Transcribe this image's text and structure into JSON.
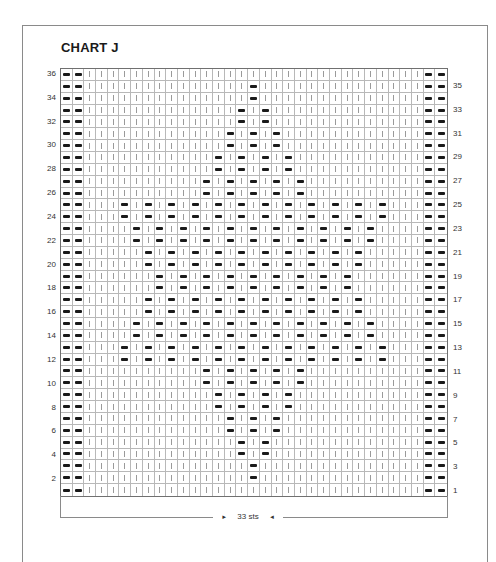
{
  "title": "CHART J",
  "chart_data": {
    "type": "table",
    "title": "CHART J",
    "columns": 33,
    "rows": 36,
    "width_label": "33 sts",
    "legend": {
      "knit": "|",
      "purl": "—"
    },
    "left_row_labels": [
      36,
      34,
      32,
      30,
      28,
      26,
      24,
      22,
      20,
      18,
      16,
      14,
      12,
      10,
      8,
      6,
      4,
      2
    ],
    "right_row_labels": [
      35,
      33,
      31,
      29,
      27,
      25,
      23,
      21,
      19,
      17,
      15,
      13,
      11,
      9,
      7,
      5,
      3,
      1
    ],
    "edge_purl_columns": [
      1,
      2,
      32,
      33
    ],
    "purl_columns_by_row": {
      "36": [],
      "35": [
        17
      ],
      "34": [
        17
      ],
      "33": [
        16,
        18
      ],
      "32": [
        16,
        18
      ],
      "31": [
        15,
        17,
        19
      ],
      "30": [
        15,
        17,
        19
      ],
      "29": [
        14,
        16,
        18,
        20
      ],
      "28": [
        14,
        16,
        18,
        20
      ],
      "27": [
        13,
        15,
        17,
        19,
        21
      ],
      "26": [
        13,
        15,
        17,
        19,
        21
      ],
      "25": [
        6,
        8,
        10,
        12,
        14,
        16,
        18,
        20,
        22,
        24,
        26,
        28
      ],
      "24": [
        6,
        8,
        10,
        12,
        14,
        16,
        18,
        20,
        22,
        24,
        26,
        28
      ],
      "23": [
        7,
        9,
        11,
        13,
        15,
        17,
        19,
        21,
        23,
        25,
        27
      ],
      "22": [
        7,
        9,
        11,
        13,
        15,
        17,
        19,
        21,
        23,
        25,
        27
      ],
      "21": [
        8,
        10,
        12,
        14,
        16,
        18,
        20,
        22,
        24,
        26
      ],
      "20": [
        8,
        10,
        12,
        14,
        16,
        18,
        20,
        22,
        24,
        26
      ],
      "19": [
        9,
        11,
        13,
        15,
        17,
        19,
        21,
        23,
        25
      ],
      "18": [
        9,
        11,
        13,
        15,
        17,
        19,
        21,
        23,
        25
      ],
      "17": [
        8,
        10,
        12,
        14,
        16,
        18,
        20,
        22,
        24,
        26
      ],
      "16": [
        8,
        10,
        12,
        14,
        16,
        18,
        20,
        22,
        24,
        26
      ],
      "15": [
        7,
        9,
        11,
        13,
        15,
        17,
        19,
        21,
        23,
        25,
        27
      ],
      "14": [
        7,
        9,
        11,
        13,
        15,
        17,
        19,
        21,
        23,
        25,
        27
      ],
      "13": [
        6,
        8,
        10,
        12,
        14,
        16,
        18,
        20,
        22,
        24,
        26,
        28
      ],
      "12": [
        6,
        8,
        10,
        12,
        14,
        16,
        18,
        20,
        22,
        24,
        26,
        28
      ],
      "11": [
        13,
        15,
        17,
        19,
        21
      ],
      "10": [
        13,
        15,
        17,
        19,
        21
      ],
      "9": [
        14,
        16,
        18,
        20
      ],
      "8": [
        14,
        16,
        18,
        20
      ],
      "7": [
        15,
        17,
        19
      ],
      "6": [
        15,
        17,
        19
      ],
      "5": [
        16,
        18
      ],
      "4": [
        16,
        18
      ],
      "3": [
        17
      ],
      "2": [
        17
      ],
      "1": []
    }
  },
  "footer": {
    "label": "33 sts",
    "arrow_left": "►",
    "arrow_right": "◄"
  }
}
